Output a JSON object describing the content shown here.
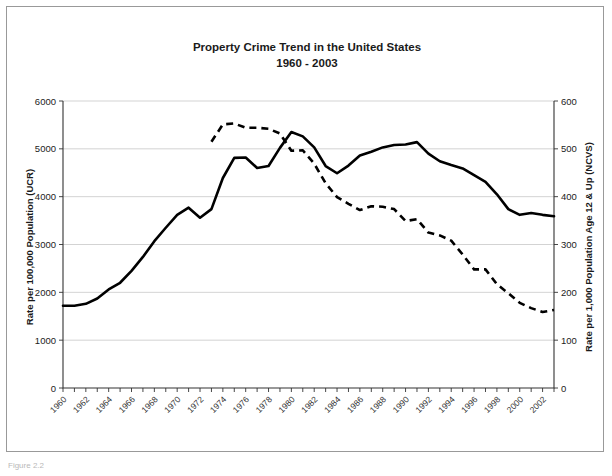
{
  "figure": {
    "caption_fragment": "Figure 2.2"
  },
  "chart_data": {
    "type": "line",
    "title": "Property Crime Trend in the United States",
    "subtitle": "1960 - 2003",
    "xlabel": "",
    "ylabel": "Rate per 100,000 Population (UCR)",
    "y2label": "Rate per 1,000 Population Age 12 & Up (NCVS)",
    "grid": true,
    "legend": "none",
    "xlim": [
      1960,
      2003
    ],
    "ylim": [
      0,
      6000
    ],
    "y2lim": [
      0,
      600
    ],
    "yticks": [
      0,
      1000,
      2000,
      3000,
      4000,
      5000,
      6000
    ],
    "ytick_labels": [
      "0",
      "1000",
      "2000",
      "3000",
      "4000",
      "5000",
      "6000"
    ],
    "y2ticks": [
      0,
      100,
      200,
      300,
      400,
      500,
      600
    ],
    "y2tick_labels": [
      "0",
      "100",
      "200",
      "300",
      "400",
      "500",
      "600"
    ],
    "x": [
      1960,
      1961,
      1962,
      1963,
      1964,
      1965,
      1966,
      1967,
      1968,
      1969,
      1970,
      1971,
      1972,
      1973,
      1974,
      1975,
      1976,
      1977,
      1978,
      1979,
      1980,
      1981,
      1982,
      1983,
      1984,
      1985,
      1986,
      1987,
      1988,
      1989,
      1990,
      1991,
      1992,
      1993,
      1994,
      1995,
      1996,
      1997,
      1998,
      1999,
      2000,
      2001,
      2002,
      2003
    ],
    "xtick_labels": [
      "1960",
      "1962",
      "1964",
      "1966",
      "1968",
      "1970",
      "1972",
      "1974",
      "1976",
      "1978",
      "1980",
      "1982",
      "1984",
      "1986",
      "1988",
      "1990",
      "1992",
      "1994",
      "1996",
      "1998",
      "2000",
      "2002"
    ],
    "xtick_label_step": 2,
    "series": [
      {
        "name": "UCR property crime rate",
        "axis": "left",
        "style": "solid",
        "color": "#000000",
        "x": [
          1960,
          1961,
          1962,
          1963,
          1964,
          1965,
          1966,
          1967,
          1968,
          1969,
          1970,
          1971,
          1972,
          1973,
          1974,
          1975,
          1976,
          1977,
          1978,
          1979,
          1980,
          1981,
          1982,
          1983,
          1984,
          1985,
          1986,
          1987,
          1988,
          1989,
          1990,
          1991,
          1992,
          1993,
          1994,
          1995,
          1996,
          1997,
          1998,
          1999,
          2000,
          2001,
          2002,
          2003
        ],
        "values": [
          1720,
          1720,
          1760,
          1870,
          2060,
          2200,
          2450,
          2740,
          3070,
          3350,
          3620,
          3770,
          3560,
          3740,
          4390,
          4810,
          4820,
          4600,
          4640,
          5020,
          5350,
          5260,
          5030,
          4640,
          4490,
          4650,
          4860,
          4940,
          5030,
          5080,
          5090,
          5140,
          4900,
          4740,
          4660,
          4590,
          4450,
          4310,
          4050,
          3740,
          3620,
          3660,
          3620,
          3590
        ]
      },
      {
        "name": "NCVS property victimization rate",
        "axis": "right",
        "style": "dashed",
        "color": "#000000",
        "x": [
          1973,
          1974,
          1975,
          1976,
          1977,
          1978,
          1979,
          1980,
          1981,
          1982,
          1983,
          1984,
          1985,
          1986,
          1987,
          1988,
          1989,
          1990,
          1991,
          1992,
          1993,
          1994,
          1995,
          1996,
          1997,
          1998,
          1999,
          2000,
          2001,
          2002,
          2003
        ],
        "values": [
          515,
          551,
          553,
          544,
          544,
          542,
          532,
          496,
          497,
          469,
          428,
          399,
          385,
          372,
          380,
          379,
          374,
          349,
          353,
          325,
          319,
          308,
          279,
          248,
          248,
          217,
          198,
          178,
          167,
          159,
          163
        ]
      }
    ]
  }
}
